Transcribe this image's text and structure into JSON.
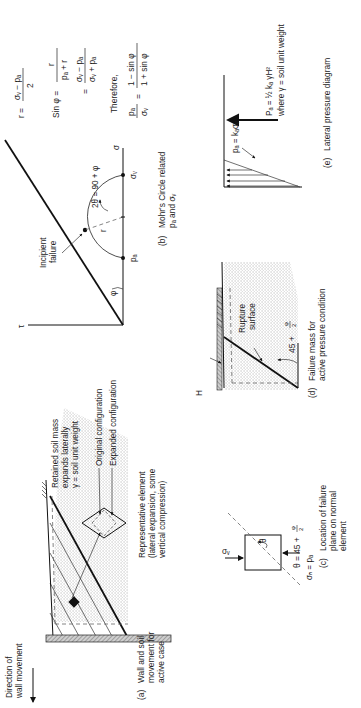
{
  "figure": {
    "orientation": "rotated 90 degrees counter-clockwise",
    "panels": {
      "a": {
        "caption_tag": "(a)",
        "caption_lines": [
          "Wall and soil",
          "movement for",
          "active case"
        ],
        "direction_label_lines": [
          "Direction of",
          "wall movement"
        ],
        "soil_label_lines": [
          "Retained soil mass",
          "expands laterally",
          "γ = soil unit weight"
        ],
        "original_config_label": "Original configuration",
        "expanded_config_label": "Expanded configuration",
        "element_label_lines": [
          "Representative element",
          "(lateral expansion, some",
          "vertical compression)"
        ]
      },
      "b": {
        "caption_tag": "(b)",
        "caption_lines": [
          "Mohr's Circle related",
          "pₐ and σᵥ"
        ],
        "tau_axis": "τ",
        "sigma_axis": "σ",
        "phi": "φ",
        "failure_label_lines": [
          "Incipient",
          "failure"
        ],
        "angle_label": "2θ = 90 + φ",
        "radius": "r",
        "pa": "pₐ",
        "sv": "σᵥ"
      },
      "equations": {
        "r_lhs": "r =",
        "r_num": "σᵥ − pₐ",
        "r_den": "2",
        "sin_lhs": "Sin φ =",
        "sin_num1": "r",
        "sin_den1": "pₐ + r",
        "eq": "=",
        "sin_num2": "σᵥ − pₐ",
        "sin_den2": "σᵥ + pₐ",
        "therefore": "Therefore,",
        "ratio_num": "pₐ",
        "ratio_den": "σᵥ",
        "result_num": "1 − sin φ",
        "result_den": "1 + sin φ"
      },
      "c": {
        "caption_tag": "(c)",
        "caption_lines": [
          "Location of failure",
          "plane on normal",
          "element"
        ],
        "sigma_v": "σᵥ",
        "sigma_h": "σₕ = pₐ",
        "theta": "θ",
        "theta_eq": "θ = 45 +",
        "phi_num": "φ",
        "phi_den": "2"
      },
      "d": {
        "caption_tag": "(d)",
        "caption_lines": [
          "Failure mass for",
          "active pressure condition"
        ],
        "rupture_lines": [
          "Rupture",
          "surface"
        ],
        "height": "H",
        "angle": "45 +",
        "phi_num": "φ",
        "phi_den": "2"
      },
      "e": {
        "caption_tag": "(e)",
        "caption_lines": [
          "Lateral pressure diagram"
        ],
        "pa_formula": "pₐ = kₐσᵥ",
        "PA_formula": "Pₐ = ½ kₐ γH²",
        "where": "where γ = soil unit weight"
      }
    }
  }
}
